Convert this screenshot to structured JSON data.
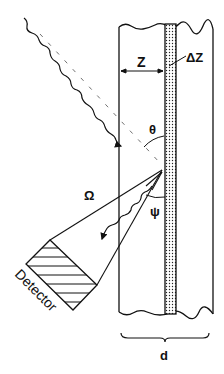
{
  "diagram": {
    "type": "physics-schematic",
    "labels": {
      "depth": "Z",
      "layer_thickness": "ΔZ",
      "incidence_angle": "θ",
      "exit_angle": "ψ",
      "solid_angle": "Ω",
      "detector": "Detector",
      "slab_thickness": "d"
    },
    "colors": {
      "ink": "#111111",
      "background": "#ffffff",
      "layer_fill": "#e6e6e6"
    }
  }
}
